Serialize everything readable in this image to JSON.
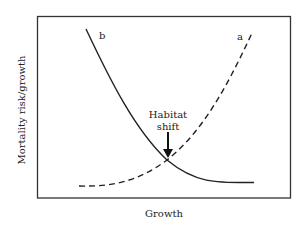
{
  "diagram": {
    "y_axis_label": "Mortality risk/growth",
    "x_axis_label": "Growth",
    "curves": [
      {
        "id": "a",
        "label": "a",
        "style": "dashed",
        "description": "rises with growth (convex increasing)"
      },
      {
        "id": "b",
        "label": "b",
        "style": "solid",
        "description": "decreases with growth (convex decreasing)"
      }
    ],
    "annotation": {
      "line1": "Habitat",
      "line2": "shift",
      "points_to": "intersection of curves a and b"
    },
    "colors": {
      "line": "#222222",
      "frame": "#333333",
      "background": "#ffffff"
    }
  }
}
